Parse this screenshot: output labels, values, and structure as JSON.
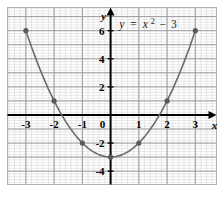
{
  "figure": {
    "title": "",
    "equation_label": "y = x² − 3",
    "equation_parts": {
      "lhs": "y",
      "equals": "=",
      "base": "x",
      "exponent": "2",
      "minus": "−",
      "constant": "3"
    },
    "axis_names": {
      "x": "x",
      "y": "y"
    },
    "colors": {
      "curve": "#6b6b6b",
      "point": "#595959",
      "axis": "#000000",
      "major_grid": "#9a9a9a",
      "minor_grid": "#d8d8d8",
      "background": "#ffffff",
      "text": "#000000"
    }
  },
  "chart_data": {
    "type": "line",
    "subtitle": "",
    "xlabel": "x",
    "ylabel": "y",
    "xlim": [
      -3.65,
      3.75
    ],
    "ylim": [
      -4.95,
      7.65
    ],
    "xticks": [
      -3,
      -2,
      -1,
      0,
      1,
      2,
      3
    ],
    "xtick_labels": [
      "-3",
      "-2",
      "-1",
      "0",
      "1",
      "2",
      "3"
    ],
    "yticks": [
      6,
      4,
      2,
      0,
      -2,
      -4
    ],
    "ytick_labels": [
      "6",
      "4",
      "2",
      "0",
      "-2",
      "-4"
    ],
    "grid": true,
    "grid_major_step": 1,
    "grid_minor_step": 0.2,
    "legend": "none",
    "annotations": [
      {
        "text": "y = x² − 3",
        "x": 1.1,
        "y": 7.0
      }
    ],
    "series": [
      {
        "name": "y = x^2 - 3",
        "type": "line",
        "equation": "y = x^2 - 3",
        "x": [
          -3.0,
          -2.8,
          -2.6,
          -2.4,
          -2.2,
          -2.0,
          -1.8,
          -1.6,
          -1.4,
          -1.2,
          -1.0,
          -0.8,
          -0.6,
          -0.4,
          -0.2,
          0.0,
          0.2,
          0.4,
          0.6,
          0.8,
          1.0,
          1.2,
          1.4,
          1.6,
          1.8,
          2.0,
          2.2,
          2.4,
          2.6,
          2.8,
          3.0
        ],
        "y": [
          6.0,
          4.84,
          3.76,
          2.76,
          1.84,
          1.0,
          0.24,
          -0.44,
          -1.04,
          -1.56,
          -2.0,
          -2.36,
          -2.64,
          -2.84,
          -2.96,
          -3.0,
          -2.96,
          -2.84,
          -2.64,
          -2.36,
          -2.0,
          -1.56,
          -1.04,
          -0.44,
          0.24,
          1.0,
          1.84,
          2.76,
          3.76,
          4.84,
          6.0
        ]
      }
    ],
    "marked_points": [
      {
        "x": -3,
        "y": 6
      },
      {
        "x": -2,
        "y": 1
      },
      {
        "x": -1,
        "y": -2
      },
      {
        "x": 0,
        "y": -3
      },
      {
        "x": 1,
        "y": -2
      },
      {
        "x": 2,
        "y": 1
      },
      {
        "x": 3,
        "y": 6
      }
    ]
  }
}
